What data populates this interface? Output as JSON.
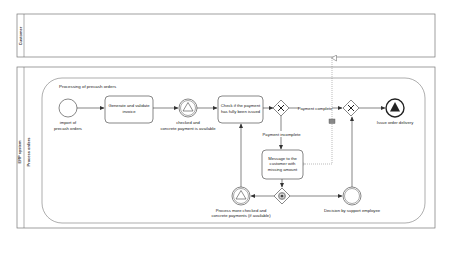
{
  "diagram": {
    "type": "BPMN collaboration",
    "colors": {
      "stroke": "#555555",
      "fill": "#ffffff",
      "text": "#222222",
      "dark": "#222222",
      "message": "#999999"
    },
    "pools": [
      {
        "id": "customer",
        "label": "Customer"
      },
      {
        "id": "erp",
        "label": "ERP system",
        "lane_label": "Process orders"
      }
    ],
    "subprocess": {
      "label": "Processing of precash orders"
    },
    "events": {
      "start": {
        "label_line1": "import of",
        "label_line2": "precash orders"
      },
      "checked": {
        "label_line1": "checked and",
        "label_line2": "concrete payment is available"
      },
      "end": {
        "label": "Issue order delivery"
      },
      "process_more": {
        "label_line1": "Process more checked and",
        "label_line2": "concrete payments (if available)"
      },
      "decision": {
        "label": "Decision by support employee"
      }
    },
    "tasks": {
      "generate": {
        "line1": "Generate and validate",
        "line2": "invoice"
      },
      "check": {
        "line1": "Check if the payment",
        "line2": "has fully been issued"
      },
      "message": {
        "line1": "Message to the",
        "line2": "customer with",
        "line3": "missing amount"
      }
    },
    "flows": {
      "payment_complete": "Payment complete",
      "payment_incomplete": "Payment incomplete"
    }
  }
}
